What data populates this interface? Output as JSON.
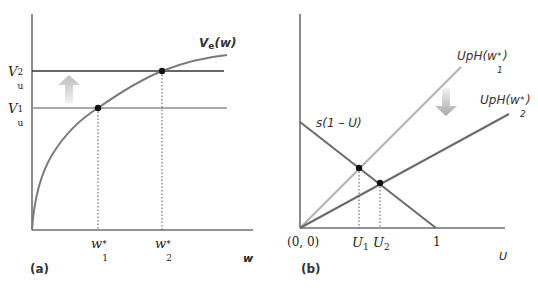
{
  "panel_a": {
    "label": "(a)",
    "x_axis_label": "w",
    "curve_label": "V",
    "curve_label_sub": "e",
    "curve_label_arg": "(w)",
    "levels": [
      {
        "base": "V",
        "sub": "u",
        "sup": "2"
      },
      {
        "base": "V",
        "sub": "u",
        "sup": "1"
      }
    ],
    "x_ticks": [
      {
        "base": "w",
        "sub": "1",
        "sup": "*"
      },
      {
        "base": "w",
        "sub": "2",
        "sup": "*"
      }
    ]
  },
  "panel_b": {
    "label": "(b)",
    "x_axis_label": "U",
    "origin_label": "(0, 0)",
    "one_label": "1",
    "line_s_label": "s(1 – U)",
    "line_1_label_pre": "UpH(w",
    "line_1_label_sub": "1",
    "line_1_label_sup": "*",
    "line_1_label_post": ")",
    "line_2_label_pre": "UpH(w",
    "line_2_label_sub": "2",
    "line_2_label_sup": "*",
    "line_2_label_post": ")",
    "x_ticks": [
      {
        "base": "U",
        "sub": "1"
      },
      {
        "base": "U",
        "sub": "2"
      }
    ]
  },
  "colors": {
    "axis": "#6e6e6e",
    "curve": "#7a7a7a",
    "level_high": "#333333",
    "level_low": "#8c8c8c",
    "line_light": "#b0b0b0",
    "line_dark": "#6a6a6a",
    "point": "#111111",
    "arrow": "#c4c4c4"
  }
}
